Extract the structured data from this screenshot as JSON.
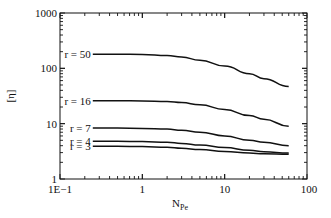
{
  "chart_data": {
    "type": "line",
    "title": "",
    "xlabel": "N",
    "xlabel_subscript": "Pe",
    "ylabel": "[η]",
    "xscale": "log",
    "yscale": "log",
    "xlim": [
      0.1,
      100
    ],
    "ylim": [
      1,
      1000
    ],
    "grid": false,
    "legend": "inline-left",
    "x_tick_labels": [
      "1E−1",
      "1",
      "10",
      "100"
    ],
    "x_tick_values": [
      0.1,
      1,
      10,
      100
    ],
    "y_tick_labels": [
      "1",
      "10",
      "100",
      "1000"
    ],
    "y_tick_values": [
      1,
      10,
      100,
      1000
    ],
    "x": [
      0.25,
      0.5,
      1,
      2,
      3,
      5,
      10,
      20,
      30,
      60
    ],
    "series": [
      {
        "name": "r = 50",
        "values": [
          180,
          180,
          178,
          170,
          160,
          140,
          110,
          80,
          65,
          47
        ]
      },
      {
        "name": "r = 16",
        "values": [
          26,
          26,
          25.8,
          25,
          24,
          22,
          18,
          14,
          12,
          9
        ]
      },
      {
        "name": "r = 7",
        "values": [
          8.3,
          8.3,
          8.2,
          8.0,
          7.6,
          7.0,
          6.0,
          5.0,
          4.6,
          4.0
        ]
      },
      {
        "name": "r = 4",
        "values": [
          4.8,
          4.8,
          4.75,
          4.6,
          4.4,
          4.1,
          3.7,
          3.3,
          3.1,
          2.95
        ]
      },
      {
        "name": "r = 3",
        "values": [
          3.9,
          3.9,
          3.85,
          3.75,
          3.6,
          3.4,
          3.15,
          2.95,
          2.85,
          2.8
        ]
      }
    ]
  }
}
